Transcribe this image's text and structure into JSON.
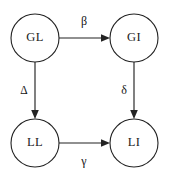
{
  "diagram": {
    "background_color": "#ffffff",
    "stroke_color": "#232323",
    "text_color": "#1c1c1c",
    "nodes": [
      {
        "id": "GL",
        "label": "GL",
        "cx": 35,
        "cy": 38,
        "r": 24
      },
      {
        "id": "GI",
        "label": "GI",
        "cx": 134,
        "cy": 38,
        "r": 24
      },
      {
        "id": "LL",
        "label": "LL",
        "cx": 35,
        "cy": 143,
        "r": 24
      },
      {
        "id": "LI",
        "label": "LI",
        "cx": 134,
        "cy": 143,
        "r": 24
      }
    ],
    "edges": [
      {
        "id": "gl-to-gi",
        "from": "GL",
        "to": "GI",
        "label": "β",
        "label_name": "beta",
        "label_x": 84,
        "label_y": 22,
        "direction": "right"
      },
      {
        "id": "gl-to-ll",
        "from": "GL",
        "to": "LL",
        "label": "Δ",
        "label_name": "delta-capital",
        "label_x": 24,
        "label_y": 91,
        "direction": "down"
      },
      {
        "id": "gi-to-li",
        "from": "GI",
        "to": "LI",
        "label": "δ",
        "label_name": "delta-lowercase",
        "label_x": 124,
        "label_y": 91,
        "direction": "down"
      },
      {
        "id": "ll-to-li",
        "from": "LL",
        "to": "LI",
        "label": "γ",
        "label_name": "gamma",
        "label_x": 84,
        "label_y": 162,
        "direction": "right"
      }
    ]
  }
}
